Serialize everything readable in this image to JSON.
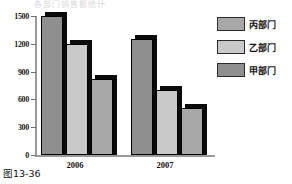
{
  "figure": {
    "caption": "图13-36",
    "faded_title": "各部门销售额统计"
  },
  "chart_data": {
    "type": "bar",
    "title": "",
    "xlabel": "",
    "ylabel": "",
    "categories": [
      "2006",
      "2007"
    ],
    "series": [
      {
        "name": "甲部门",
        "values": [
          1500,
          1250
        ],
        "color": "#8f8f8f"
      },
      {
        "name": "乙部门",
        "values": [
          1200,
          700
        ],
        "color": "#c9c9c9"
      },
      {
        "name": "丙部门",
        "values": [
          820,
          510
        ],
        "color": "#a8a8a8"
      }
    ],
    "ylim": [
      0,
      1500
    ],
    "yticks": [
      0,
      300,
      600,
      900,
      1200,
      1500
    ],
    "ytick_labels": [
      "0",
      "300",
      "600",
      "900",
      "1200",
      "1500"
    ],
    "grid": false,
    "legend_position": "right",
    "legend_order": [
      "丙部门",
      "乙部门",
      "甲部门"
    ]
  },
  "legend": {
    "items": [
      {
        "label": "丙部门",
        "color": "#a8a8a8"
      },
      {
        "label": "乙部门",
        "color": "#c9c9c9"
      },
      {
        "label": "甲部门",
        "color": "#8f8f8f"
      }
    ]
  }
}
